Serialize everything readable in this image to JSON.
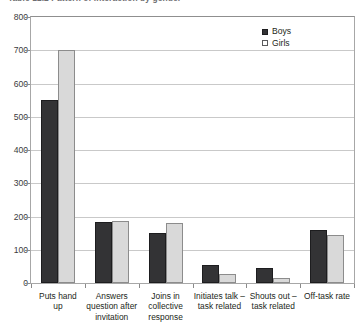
{
  "caption": {
    "text": "Table 12.2  Pattern of interaction by gender"
  },
  "legend": {
    "position": "top-right",
    "items": [
      {
        "label": "Boys",
        "color": "#333335"
      },
      {
        "label": "Girls",
        "color": "#d9d9d9"
      }
    ]
  },
  "axes": {
    "y_ticks": [
      "0",
      "100",
      "200",
      "300",
      "400",
      "500",
      "600",
      "700",
      "800"
    ],
    "x_labels": [
      "Puts hand\nup",
      "Answers\nquestion after\ninvitation",
      "Joins in\ncollective\nresponse",
      "Initiates talk –\ntask related",
      "Shouts out –\ntask related",
      "Off-task rate"
    ]
  },
  "chart_data": {
    "type": "bar",
    "title": "Table 12.2  Pattern of interaction by gender",
    "xlabel": "",
    "ylabel": "",
    "ylim": [
      0,
      800
    ],
    "ytick_step": 100,
    "grid": true,
    "legend_position": "top-right",
    "categories": [
      "Puts hand up",
      "Answers question after invitation",
      "Joins in collective response",
      "Initiates talk – task related",
      "Shouts out – task related",
      "Off-task rate"
    ],
    "series": [
      {
        "name": "Boys",
        "color": "#333335",
        "values": [
          550,
          185,
          150,
          55,
          45,
          160
        ]
      },
      {
        "name": "Girls",
        "color": "#d9d9d9",
        "values": [
          700,
          188,
          180,
          28,
          15,
          145
        ]
      }
    ]
  }
}
